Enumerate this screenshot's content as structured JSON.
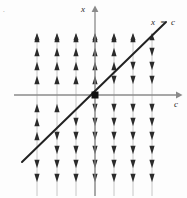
{
  "figure": {
    "background_color": "#fdfdfd",
    "axis_color": "#8a8a8a",
    "field_line_color": "#c6c6c6",
    "arrow_color": "#2b2b2b",
    "solution_line_color": "#222222",
    "corner_mark": "."
  },
  "labels": {
    "y_axis": "x",
    "x_axis": "c",
    "curve_var": "x",
    "curve_eq": "=",
    "curve_val": "c"
  },
  "chart_data": {
    "type": "line",
    "title": "",
    "xlabel": "c",
    "ylabel": "x",
    "grid": false,
    "legend": "none",
    "axes": {
      "origin_px": [
        95,
        95
      ],
      "x_axis_y_px": 95,
      "y_axis_x_px": 95,
      "x_range_px": [
        14,
        179
      ],
      "y_range_px": [
        6,
        196
      ]
    },
    "solution_line": {
      "label": "x = c",
      "slope": 1,
      "intercept": 0,
      "start_px": [
        22,
        162
      ],
      "end_px": [
        166,
        22
      ]
    },
    "field_lines_x_px": [
      37,
      57,
      76,
      95,
      114,
      133,
      152
    ],
    "field_line_top_px": 36,
    "field_line_bottom_px": 196,
    "arrow_rows_y_px": [
      38,
      52,
      66,
      80,
      108,
      122,
      136,
      150,
      164,
      178
    ],
    "arrow_rule": "points up above the line x = c, points down below the line x = c",
    "series": [
      {
        "name": "x = c",
        "x": [
          -5,
          5
        ],
        "values": [
          -5,
          5
        ]
      }
    ]
  }
}
